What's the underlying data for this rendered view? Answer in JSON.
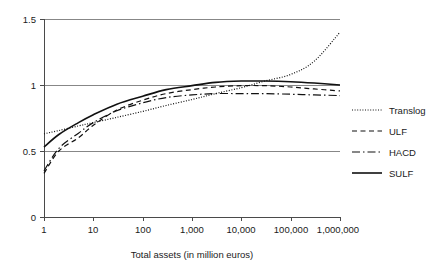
{
  "chart_data": {
    "type": "line",
    "title": "",
    "subtitle": "",
    "xlabel": "Total assets (in million euros)",
    "ylabel": "",
    "xscale": "log",
    "xlim": [
      1,
      1000000
    ],
    "ylim": [
      0,
      1.5
    ],
    "grid": true,
    "grid_axis": "y",
    "legend_position": "right",
    "x_tick_labels": [
      "1",
      "10",
      "100",
      "1,000",
      "10,000",
      "100,000",
      "1,000,000"
    ],
    "x_tick_values": [
      1,
      10,
      100,
      1000,
      10000,
      100000,
      1000000
    ],
    "y_tick_labels": [
      "0",
      "0.5",
      "1",
      "1.5"
    ],
    "y_tick_values": [
      0,
      0.5,
      1,
      1.5
    ],
    "x": [
      1,
      2,
      5,
      10,
      30,
      100,
      300,
      1000,
      3000,
      10000,
      30000,
      100000,
      300000,
      1000000
    ],
    "series": [
      {
        "name": "Translog",
        "style": "dotted",
        "color": "#111111",
        "values": [
          0.63,
          0.655,
          0.69,
          0.715,
          0.755,
          0.8,
          0.845,
          0.89,
          0.935,
          0.98,
          1.03,
          1.08,
          1.18,
          1.4
        ]
      },
      {
        "name": "ULF",
        "style": "dashed",
        "color": "#111111",
        "values": [
          0.33,
          0.5,
          0.6,
          0.695,
          0.81,
          0.885,
          0.935,
          0.965,
          0.985,
          0.995,
          0.995,
          0.985,
          0.97,
          0.955
        ]
      },
      {
        "name": "HACD",
        "style": "dashdot",
        "color": "#111111",
        "values": [
          0.35,
          0.52,
          0.635,
          0.715,
          0.805,
          0.865,
          0.905,
          0.925,
          0.935,
          0.935,
          0.935,
          0.93,
          0.925,
          0.92
        ]
      },
      {
        "name": "SULF",
        "style": "solid",
        "color": "#111111",
        "values": [
          0.53,
          0.625,
          0.715,
          0.775,
          0.855,
          0.915,
          0.965,
          0.995,
          1.02,
          1.03,
          1.03,
          1.025,
          1.015,
          1.0
        ]
      }
    ],
    "annotations": []
  },
  "legend": {
    "items": [
      {
        "label": "Translog",
        "style": "dotted"
      },
      {
        "label": "ULF",
        "style": "dashed"
      },
      {
        "label": "HACD",
        "style": "dashdot"
      },
      {
        "label": "SULF",
        "style": "solid"
      }
    ]
  },
  "axes": {
    "x_title": "Total assets (in million euros)"
  }
}
